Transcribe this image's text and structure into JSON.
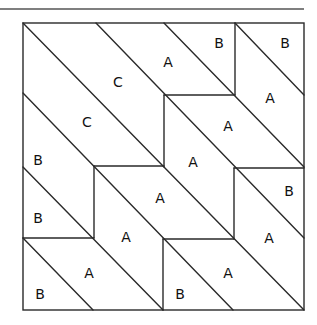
{
  "diagram": {
    "title": "",
    "type": "quilt-block-pattern",
    "top_rule": {
      "x1": 0,
      "y1": 9,
      "x2": 304,
      "y2": 9
    },
    "border": {
      "x": 23,
      "y": 23,
      "width": 281,
      "height": 287
    },
    "segments": [
      {
        "x1": 235,
        "y1": 23,
        "x2": 235,
        "y2": 95
      },
      {
        "x1": 164,
        "y1": 95,
        "x2": 235,
        "y2": 95
      },
      {
        "x1": 164,
        "y1": 95,
        "x2": 164,
        "y2": 167
      },
      {
        "x1": 94,
        "y1": 166,
        "x2": 164,
        "y2": 166
      },
      {
        "x1": 94,
        "y1": 166,
        "x2": 94,
        "y2": 238
      },
      {
        "x1": 23,
        "y1": 238,
        "x2": 94,
        "y2": 238
      },
      {
        "x1": 234,
        "y1": 168,
        "x2": 304,
        "y2": 168
      },
      {
        "x1": 234,
        "y1": 168,
        "x2": 234,
        "y2": 239
      },
      {
        "x1": 163,
        "y1": 239,
        "x2": 234,
        "y2": 239
      },
      {
        "x1": 163,
        "y1": 239,
        "x2": 163,
        "y2": 310
      }
    ],
    "diagonals": [
      {
        "x1": 235,
        "y1": 23,
        "x2": 304,
        "y2": 95
      },
      {
        "x1": 164,
        "y1": 23,
        "x2": 304,
        "y2": 167
      },
      {
        "x1": 96,
        "y1": 23,
        "x2": 304,
        "y2": 238
      },
      {
        "x1": 23,
        "y1": 23,
        "x2": 304,
        "y2": 310
      },
      {
        "x1": 23,
        "y1": 93,
        "x2": 233,
        "y2": 310
      },
      {
        "x1": 23,
        "y1": 167,
        "x2": 163,
        "y2": 310
      },
      {
        "x1": 23,
        "y1": 238,
        "x2": 93,
        "y2": 310
      }
    ],
    "labels": [
      {
        "text": "C",
        "x": 118,
        "y": 82
      },
      {
        "text": "C",
        "x": 87,
        "y": 122
      },
      {
        "text": "A",
        "x": 168,
        "y": 62
      },
      {
        "text": "B",
        "x": 219,
        "y": 43
      },
      {
        "text": "B",
        "x": 285,
        "y": 43
      },
      {
        "text": "A",
        "x": 270,
        "y": 98
      },
      {
        "text": "A",
        "x": 228,
        "y": 126
      },
      {
        "text": "A",
        "x": 193,
        "y": 162
      },
      {
        "text": "B",
        "x": 38,
        "y": 160
      },
      {
        "text": "B",
        "x": 38,
        "y": 218
      },
      {
        "text": "A",
        "x": 160,
        "y": 198
      },
      {
        "text": "B",
        "x": 289,
        "y": 191
      },
      {
        "text": "A",
        "x": 126,
        "y": 237
      },
      {
        "text": "A",
        "x": 269,
        "y": 238
      },
      {
        "text": "A",
        "x": 89,
        "y": 273
      },
      {
        "text": "A",
        "x": 228,
        "y": 273
      },
      {
        "text": "B",
        "x": 40,
        "y": 294
      },
      {
        "text": "B",
        "x": 180,
        "y": 294
      }
    ]
  }
}
